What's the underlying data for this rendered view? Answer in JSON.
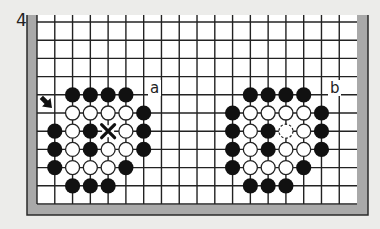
{
  "figure": {
    "number": "4",
    "labels": [
      {
        "id": "a",
        "text": "a",
        "x": 150,
        "y": 93
      },
      {
        "id": "b",
        "text": "b",
        "x": 330,
        "y": 93
      }
    ]
  },
  "board": {
    "colors": {
      "paper": "#ececea",
      "board": "#ffffff",
      "border": "#a9a9a9",
      "outline": "#2a2a2a",
      "grid": "#222222",
      "black_stone": "#111111",
      "white_stone": "#ffffff"
    },
    "grid": {
      "x0": 37,
      "dx": 17.78,
      "cols": 18,
      "y0": 22,
      "dy": 18.2,
      "rows": 11,
      "top_edge": 15
    },
    "frame": {
      "left": 27,
      "right": 368,
      "bottom": 215,
      "inner_left": 37,
      "inner_right": 357,
      "inner_bottom": 205
    }
  },
  "diagrams": [
    {
      "id": "a",
      "black": [
        [
          2,
          4
        ],
        [
          3,
          4
        ],
        [
          4,
          4
        ],
        [
          5,
          4
        ],
        [
          6,
          5
        ],
        [
          1,
          6
        ],
        [
          3,
          6
        ],
        [
          6,
          6
        ],
        [
          1,
          7
        ],
        [
          3,
          7
        ],
        [
          6,
          7
        ],
        [
          1,
          8
        ],
        [
          5,
          8
        ],
        [
          2,
          9
        ],
        [
          3,
          9
        ],
        [
          4,
          9
        ]
      ],
      "white": [
        [
          2,
          5
        ],
        [
          3,
          5
        ],
        [
          4,
          5
        ],
        [
          5,
          5
        ],
        [
          2,
          6
        ],
        [
          5,
          6
        ],
        [
          2,
          7
        ],
        [
          4,
          7
        ],
        [
          5,
          7
        ],
        [
          2,
          8
        ],
        [
          3,
          8
        ],
        [
          4,
          8
        ]
      ],
      "white_dashed": [],
      "cross_marks": [
        [
          4,
          6
        ]
      ],
      "arrow": {
        "x": 47,
        "y": 103,
        "direction": "southeast",
        "target": [
          1,
          5
        ]
      }
    },
    {
      "id": "b",
      "black": [
        [
          12,
          4
        ],
        [
          13,
          4
        ],
        [
          14,
          4
        ],
        [
          15,
          4
        ],
        [
          11,
          5
        ],
        [
          16,
          5
        ],
        [
          11,
          6
        ],
        [
          13,
          6
        ],
        [
          16,
          6
        ],
        [
          11,
          7
        ],
        [
          13,
          7
        ],
        [
          16,
          7
        ],
        [
          11,
          8
        ],
        [
          15,
          8
        ],
        [
          12,
          9
        ],
        [
          13,
          9
        ],
        [
          14,
          9
        ]
      ],
      "white": [
        [
          12,
          5
        ],
        [
          13,
          5
        ],
        [
          14,
          5
        ],
        [
          15,
          5
        ],
        [
          12,
          6
        ],
        [
          15,
          6
        ],
        [
          12,
          7
        ],
        [
          14,
          7
        ],
        [
          15,
          7
        ],
        [
          12,
          8
        ],
        [
          13,
          8
        ],
        [
          14,
          8
        ]
      ],
      "white_dashed": [
        [
          14,
          6
        ]
      ],
      "cross_marks": [],
      "arrow": null
    }
  ]
}
